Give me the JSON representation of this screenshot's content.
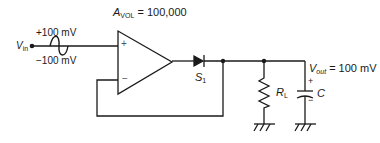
{
  "diagram": {
    "type": "precision-half-wave-rectifier",
    "gain_label": {
      "symbol": "A",
      "subscript": "VOL",
      "value": "= 100,000"
    },
    "input": {
      "symbol": "V",
      "subscript": "in",
      "peak_positive": "+100 mV",
      "peak_negative": "−100 mV"
    },
    "opamp": {
      "noninverting_sign": "+",
      "inverting_sign": "−"
    },
    "diode": {
      "symbol": "S",
      "subscript": "1"
    },
    "load": {
      "symbol": "R",
      "subscript": "L"
    },
    "capacitor": {
      "symbol": "C",
      "plus": "+",
      "minus": "−"
    },
    "output": {
      "symbol": "V",
      "subscript": "out",
      "value": "= 100 mV"
    }
  },
  "colors": {
    "line": "#1a1a1a",
    "background": "#ffffff"
  }
}
